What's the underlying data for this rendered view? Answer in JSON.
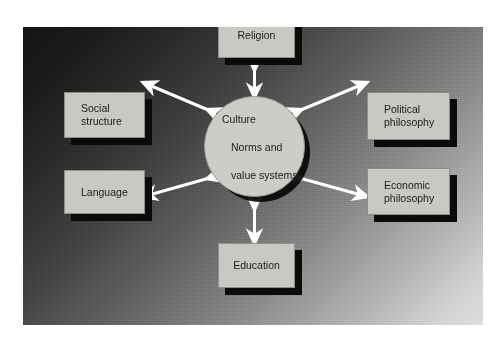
{
  "figure": {
    "background_color": "#ffffff",
    "panel": {
      "gradient_from": "#141414",
      "gradient_to": "#dedede",
      "gradient_direction": "top-left dark to bottom-right light"
    }
  },
  "diagram": {
    "type": "hub-and-spoke",
    "box_fill_color": "#c9c9c4",
    "box_shadow_color": "#0b0b0b",
    "arrow_color": "#ffffff",
    "text_color": "#1a1a1a",
    "center": {
      "shape": "circle",
      "line1": "Culture",
      "line2": "Norms and",
      "line3": "value systems"
    },
    "nodes": [
      {
        "id": "religion",
        "label": "Religion",
        "position": "top"
      },
      {
        "id": "social-structure",
        "label": "Social\nstructure",
        "position": "left-upper"
      },
      {
        "id": "language",
        "label": "Language",
        "position": "left-lower"
      },
      {
        "id": "political-philosophy",
        "label": "Political\nphilosophy",
        "position": "right-upper"
      },
      {
        "id": "economic-philosophy",
        "label": "Economic\nphilosophy",
        "position": "right-lower"
      },
      {
        "id": "education",
        "label": "Education",
        "position": "bottom"
      }
    ],
    "connectors": [
      {
        "id": "religion-link",
        "from": "religion",
        "to": "center",
        "style": "double-headed-arrow"
      },
      {
        "id": "social-structure-link",
        "from": "social-structure",
        "to": "center",
        "style": "double-headed-arrow"
      },
      {
        "id": "language-link",
        "from": "language",
        "to": "center",
        "style": "double-headed-arrow"
      },
      {
        "id": "political-philosophy-link",
        "from": "political-philosophy",
        "to": "center",
        "style": "double-headed-arrow"
      },
      {
        "id": "economic-philosophy-link",
        "from": "economic-philosophy",
        "to": "center",
        "style": "double-headed-arrow"
      },
      {
        "id": "education-link",
        "from": "education",
        "to": "center",
        "style": "double-headed-arrow"
      }
    ]
  }
}
